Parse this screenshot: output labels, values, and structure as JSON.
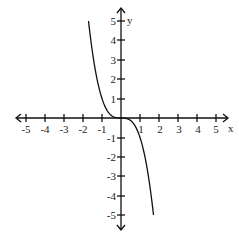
{
  "chart_data": {
    "type": "line",
    "title": "",
    "xlabel": "x",
    "ylabel": "y",
    "xlim": [
      -5,
      5
    ],
    "ylim": [
      -5,
      5
    ],
    "grid": false,
    "legend": null,
    "x_ticks": [
      "-5",
      "-4",
      "-3",
      "-2",
      "-1",
      "1",
      "2",
      "3",
      "4",
      "5"
    ],
    "y_ticks": [
      "5",
      "4",
      "3",
      "2",
      "1",
      "-1",
      "-2",
      "-3",
      "-4",
      "-5"
    ],
    "series": [
      {
        "name": "y = -x^3",
        "x": [
          -1.71,
          -1.5,
          -1.25,
          -1.0,
          -0.75,
          -0.5,
          -0.25,
          0,
          0.25,
          0.5,
          0.75,
          1.0,
          1.25,
          1.5,
          1.71
        ],
        "y": [
          5.0,
          3.375,
          1.953,
          1.0,
          0.422,
          0.125,
          0.016,
          0,
          -0.016,
          -0.125,
          -0.422,
          -1.0,
          -1.953,
          -3.375,
          -5.0
        ]
      }
    ]
  },
  "axes": {
    "x_label": "x",
    "y_label": "y",
    "x_tick_labels": [
      "-5",
      "-4",
      "-3",
      "-2",
      "-1",
      "1",
      "2",
      "3",
      "4",
      "5"
    ],
    "y_tick_labels_pos": [
      "5",
      "4",
      "3",
      "2",
      "1"
    ],
    "y_tick_labels_neg": [
      "-1",
      "-2",
      "-3",
      "-4",
      "-5"
    ]
  }
}
